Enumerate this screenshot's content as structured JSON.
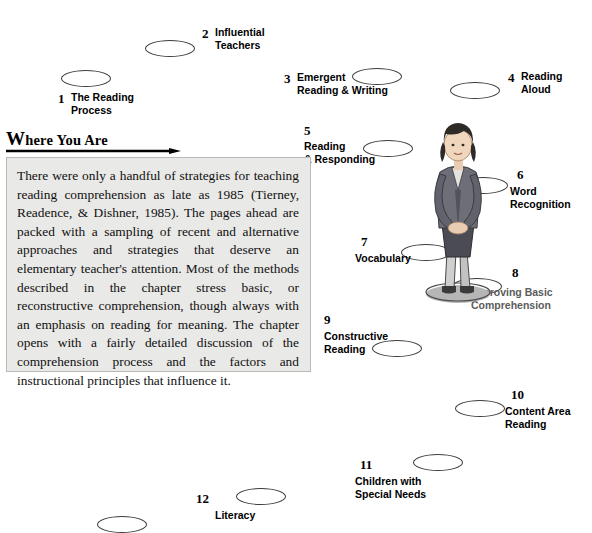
{
  "heading": {
    "first_letter": "W",
    "rest": "here You Are"
  },
  "body": {
    "paragraph": "There were only a handful of strategies for teaching reading comprehension as late as 1985 (Tierney, Readence, & Dishner, 1985). The pages ahead are packed with a sampling of recent and alternative approaches and strategies that deserve an elementary teacher's attention. Most of the methods described in the chapter stress basic, or reconstructive comprehension, though always with an emphasis on reading for meaning. The chapter opens with a fairly detailed discussion of the comprehension process and the factors and instructional principles that influence it."
  },
  "steps": [
    {
      "number": "1",
      "label": "The Reading\nProcess"
    },
    {
      "number": "2",
      "label": "Influential\nTeachers"
    },
    {
      "number": "3",
      "label": "Emergent\nReading & Writing"
    },
    {
      "number": "4",
      "label": "Reading\nAloud"
    },
    {
      "number": "5",
      "label": "Reading\n& Responding"
    },
    {
      "number": "6",
      "label": "Word\nRecognition"
    },
    {
      "number": "7",
      "label": "Vocabulary"
    },
    {
      "number": "8",
      "label": "Improving Basic\nComprehension"
    },
    {
      "number": "9",
      "label": "Constructive\nReading"
    },
    {
      "number": "10",
      "label": "Content Area\nReading"
    },
    {
      "number": "11",
      "label": "Children with\nSpecial Needs"
    },
    {
      "number": "12",
      "label": "Literacy"
    }
  ],
  "colors": {
    "textbox_background": "#e9e9e7",
    "ellipse_stroke": "#3d3d3d",
    "step8_label": "#5b5b5b"
  }
}
